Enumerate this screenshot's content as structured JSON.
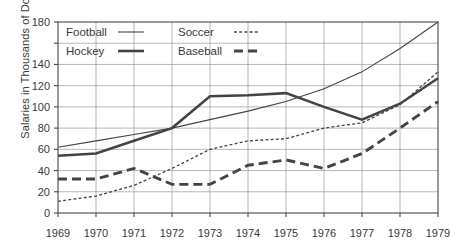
{
  "chart_data": {
    "type": "line",
    "title": "",
    "xlabel": "",
    "ylabel": "Salaries in Thousands of Dollars",
    "categories": [
      "1969",
      "1970",
      "1971",
      "1972",
      "1973",
      "1974",
      "1975",
      "1976",
      "1977",
      "1978",
      "1979"
    ],
    "x": [
      1969,
      1970,
      1971,
      1972,
      1973,
      1974,
      1975,
      1976,
      1977,
      1978,
      1979
    ],
    "ylim": [
      0,
      180
    ],
    "xlim": [
      1969,
      1979
    ],
    "grid": true,
    "legend_position": "top-left inside plot",
    "y_ticks": [
      0,
      20,
      40,
      60,
      80,
      100,
      120,
      140,
      160,
      180
    ],
    "y_tick_labels": [
      "0",
      "20",
      "40",
      "60",
      "80",
      "100",
      "120",
      "140",
      "",
      "180"
    ],
    "series": [
      {
        "name": "Football",
        "style": "thin-solid",
        "color": "#444444",
        "values": [
          62,
          68,
          74,
          80,
          88,
          96,
          105,
          117,
          133,
          155,
          180
        ]
      },
      {
        "name": "Soccer",
        "style": "fine-dotted",
        "color": "#444444",
        "values": [
          11,
          16,
          26,
          42,
          60,
          68,
          70,
          80,
          85,
          102,
          133
        ]
      },
      {
        "name": "Hockey",
        "style": "thick-solid",
        "color": "#444444",
        "values": [
          54,
          56,
          68,
          80,
          110,
          111,
          113,
          100,
          88,
          103,
          127
        ]
      },
      {
        "name": "Baseball",
        "style": "thick-dashed",
        "color": "#444444",
        "values": [
          32,
          32,
          42,
          27,
          27,
          45,
          50,
          42,
          56,
          80,
          105
        ]
      }
    ]
  },
  "legend": {
    "entries": [
      {
        "label": "Football",
        "style": "thin-solid"
      },
      {
        "label": "Soccer",
        "style": "fine-dotted"
      },
      {
        "label": "Hockey",
        "style": "thick-solid"
      },
      {
        "label": "Baseball",
        "style": "thick-dashed"
      }
    ]
  },
  "axis": {
    "y_title": "Salaries in Thousands of Dollars"
  }
}
